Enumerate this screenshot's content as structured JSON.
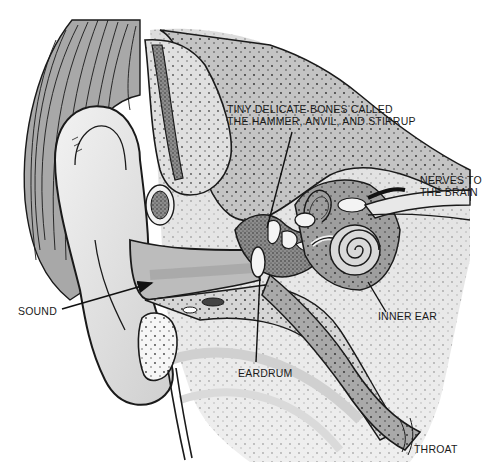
{
  "diagram": {
    "type": "anatomical-cross-section",
    "style": "black-and-white pen illustration with gray stipple shading",
    "colors": {
      "background": "#ffffff",
      "ink": "#1a1a1a",
      "skin_light": "#e6e6e6",
      "tissue_mid": "#bdbdbd",
      "tissue_dark": "#8a8a8a",
      "hair": "#9a9a9a"
    },
    "labels": {
      "bones": {
        "line1": "TINY DELICATE BONES CALLED",
        "line2": "THE HAMMER, ANVIL, AND STIRRUP"
      },
      "nerves": {
        "line1": "NERVES TO",
        "line2": "THE BRAIN"
      },
      "sound": "SOUND",
      "inner_ear": "INNER EAR",
      "eardrum": "EARDRUM",
      "throat": "THROAT"
    }
  }
}
